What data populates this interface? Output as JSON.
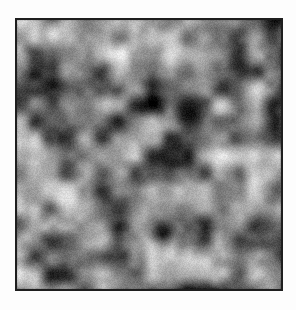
{
  "page": {
    "background_color": "#fdfdfd",
    "width": 296,
    "height": 310,
    "caption": ""
  },
  "figure": {
    "name": "grayscale-noise-texture",
    "border_color": "#1e1e1e",
    "border_width_px": 2,
    "x": 15,
    "y": 18,
    "width": 268,
    "height": 273,
    "plot_width": 264,
    "plot_height": 269
  },
  "chart_data": {
    "type": "heatmap",
    "title": "",
    "subtitle": "",
    "xlabel": "",
    "ylabel": "",
    "colormap": "gray",
    "grid": false,
    "legend": "none",
    "interpolation": "bilinear",
    "xlim": [
      0,
      264
    ],
    "ylim": [
      0,
      269
    ],
    "value_range": [
      0,
      255
    ],
    "mean_value": 128,
    "std_value": 42,
    "grain_amplitude": 11,
    "octaves": [
      {
        "cell_px": 17,
        "weight": 1.0
      },
      {
        "cell_px": 34,
        "weight": 0.55
      },
      {
        "cell_px": 68,
        "weight": 0.3
      },
      {
        "cell_px": 9,
        "weight": 0.22
      }
    ],
    "seed": 20240517,
    "notable_features": [
      {
        "name": "darkest-blob-upper-right",
        "x": 172,
        "y": 93,
        "value": 14
      },
      {
        "name": "dark-blob-lower-center",
        "x": 146,
        "y": 212,
        "value": 22
      },
      {
        "name": "bright-ridge-left",
        "x": 48,
        "y": 176,
        "value": 225
      },
      {
        "name": "bright-band-upper-left",
        "x": 36,
        "y": 14,
        "value": 218
      },
      {
        "name": "bright-patch-right",
        "x": 236,
        "y": 136,
        "value": 214
      }
    ]
  }
}
